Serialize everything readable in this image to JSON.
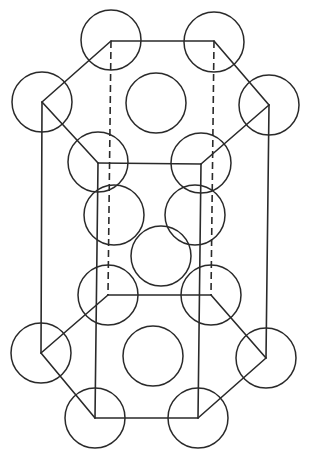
{
  "diagram": {
    "type": "hcp-unit-cell",
    "stroke_color": "#2a2a2a",
    "background": "#ffffff",
    "atom_radius": 30,
    "vertices": {
      "top_back_left": [
        111,
        41
      ],
      "top_back_right": [
        214,
        41
      ],
      "top_left": [
        42,
        102
      ],
      "top_right": [
        269,
        105
      ],
      "top_front_left": [
        98,
        163
      ],
      "top_front_right": [
        201,
        164
      ],
      "bottom_back_left": [
        108,
        295
      ],
      "bottom_back_right": [
        211,
        295
      ],
      "bottom_left": [
        41,
        353
      ],
      "bottom_right": [
        266,
        358
      ],
      "bottom_front_left": [
        95,
        418
      ],
      "bottom_front_right": [
        198,
        418
      ]
    },
    "atoms": {
      "top_layer": [
        {
          "name": "top-back-left",
          "cx": 111,
          "cy": 40
        },
        {
          "name": "top-back-right",
          "cx": 214,
          "cy": 42
        },
        {
          "name": "top-left",
          "cx": 42,
          "cy": 102
        },
        {
          "name": "top-right",
          "cx": 269,
          "cy": 105
        },
        {
          "name": "top-front-left",
          "cx": 98,
          "cy": 162
        },
        {
          "name": "top-front-right",
          "cx": 201,
          "cy": 163
        },
        {
          "name": "top-center",
          "cx": 156,
          "cy": 103
        }
      ],
      "middle_layer": [
        {
          "name": "middle-left",
          "cx": 114,
          "cy": 215
        },
        {
          "name": "middle-right",
          "cx": 195,
          "cy": 215
        },
        {
          "name": "middle-center",
          "cx": 161,
          "cy": 256
        }
      ],
      "bottom_layer": [
        {
          "name": "bottom-back-left",
          "cx": 108,
          "cy": 295
        },
        {
          "name": "bottom-back-right",
          "cx": 211,
          "cy": 295
        },
        {
          "name": "bottom-left",
          "cx": 41,
          "cy": 353
        },
        {
          "name": "bottom-right",
          "cx": 266,
          "cy": 358
        },
        {
          "name": "bottom-front-left",
          "cx": 95,
          "cy": 418
        },
        {
          "name": "bottom-front-right",
          "cx": 198,
          "cy": 418
        },
        {
          "name": "bottom-center",
          "cx": 153,
          "cy": 356
        }
      ]
    },
    "edges": {
      "solid": [
        [
          [
            111,
            41
          ],
          [
            214,
            41
          ]
        ],
        [
          [
            214,
            41
          ],
          [
            269,
            105
          ]
        ],
        [
          [
            269,
            105
          ],
          [
            201,
            164
          ]
        ],
        [
          [
            201,
            164
          ],
          [
            98,
            163
          ]
        ],
        [
          [
            98,
            163
          ],
          [
            42,
            102
          ]
        ],
        [
          [
            42,
            102
          ],
          [
            111,
            41
          ]
        ],
        [
          [
            108,
            295
          ],
          [
            211,
            295
          ]
        ],
        [
          [
            211,
            295
          ],
          [
            266,
            358
          ]
        ],
        [
          [
            266,
            358
          ],
          [
            198,
            418
          ]
        ],
        [
          [
            198,
            418
          ],
          [
            95,
            418
          ]
        ],
        [
          [
            95,
            418
          ],
          [
            41,
            353
          ]
        ],
        [
          [
            41,
            353
          ],
          [
            108,
            295
          ]
        ],
        [
          [
            42,
            102
          ],
          [
            41,
            353
          ]
        ],
        [
          [
            269,
            105
          ],
          [
            266,
            358
          ]
        ],
        [
          [
            98,
            163
          ],
          [
            95,
            418
          ]
        ],
        [
          [
            201,
            164
          ],
          [
            198,
            418
          ]
        ]
      ],
      "hidden": [
        [
          [
            111,
            41
          ],
          [
            108,
            295
          ]
        ],
        [
          [
            214,
            41
          ],
          [
            211,
            295
          ]
        ]
      ]
    }
  }
}
